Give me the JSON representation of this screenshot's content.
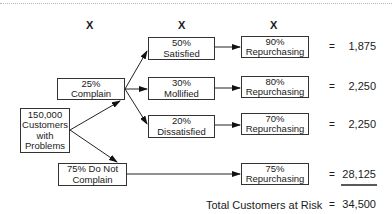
{
  "header": {
    "multipliers": [
      "X",
      "X",
      "X"
    ]
  },
  "root": {
    "lines": [
      "150,000",
      "Customers",
      "with",
      "Problems"
    ]
  },
  "level1": [
    {
      "lines": [
        "25%",
        "Complain"
      ]
    },
    {
      "lines": [
        "75% Do Not",
        "Complain"
      ]
    }
  ],
  "level2": [
    {
      "lines": [
        "50%",
        "Satisfied"
      ]
    },
    {
      "lines": [
        "30%",
        "Mollified"
      ]
    },
    {
      "lines": [
        "20%",
        "Dissatisfied"
      ]
    }
  ],
  "repurchase": [
    {
      "lines": [
        "90%",
        "Repurchasing"
      ],
      "equals": "=",
      "value": "1,875"
    },
    {
      "lines": [
        "80%",
        "Repurchasing"
      ],
      "equals": "=",
      "value": "2,250"
    },
    {
      "lines": [
        "70%",
        "Repurchasing"
      ],
      "equals": "=",
      "value": "2,250"
    },
    {
      "lines": [
        "75%",
        "Repurchasing"
      ],
      "equals": "=",
      "value": "28,125"
    }
  ],
  "total": {
    "label": "Total Customers at Risk",
    "equals": "=",
    "value": "34,500"
  }
}
